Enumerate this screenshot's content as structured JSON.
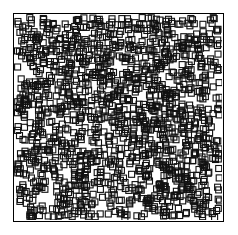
{
  "chart_data": {
    "type": "scatter",
    "title": "",
    "xlabel": "",
    "ylabel": "",
    "xlim": [
      0,
      1
    ],
    "ylim": [
      0,
      1
    ],
    "grid": false,
    "legend": null,
    "series": [
      {
        "name": "points",
        "marker": "square-open",
        "marker_color": "#111111",
        "marker_size_px": 6,
        "count": 1500,
        "distribution": "uniform-random",
        "seed": 7
      }
    ],
    "tick_labels": {
      "x": [],
      "y": []
    }
  },
  "colors": {
    "background": "#ffffff",
    "frame": "#000000",
    "marker": "#111111"
  }
}
